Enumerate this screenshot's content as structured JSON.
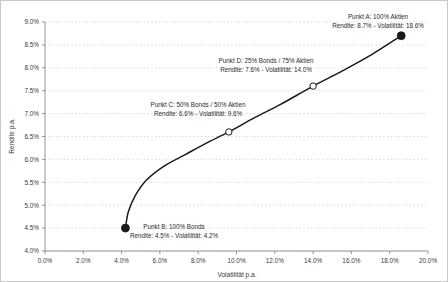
{
  "chart_data": {
    "type": "line",
    "title": "",
    "subtitle": "",
    "xlabel": "Volatilität p.a.",
    "ylabel": "Rendite p.a.",
    "xlim": [
      0.0,
      20.0
    ],
    "ylim": [
      4.0,
      9.0
    ],
    "xticks": [
      "0.0%",
      "2.0%",
      "4.0%",
      "6.0%",
      "8.0%",
      "10.0%",
      "12.0%",
      "14.0%",
      "16.0%",
      "18.0%",
      "20.0%"
    ],
    "xtick_values": [
      0.0,
      2.0,
      4.0,
      6.0,
      8.0,
      10.0,
      12.0,
      14.0,
      16.0,
      18.0,
      20.0
    ],
    "yticks": [
      "4.0%",
      "4.5%",
      "5.0%",
      "5.5%",
      "6.0%",
      "6.5%",
      "7.0%",
      "7.5%",
      "8.0%",
      "8.5%",
      "9.0%"
    ],
    "ytick_values": [
      4.0,
      4.5,
      5.0,
      5.5,
      6.0,
      6.5,
      7.0,
      7.5,
      8.0,
      8.5,
      9.0
    ],
    "grid": true,
    "grid_axis": "y",
    "legend": "none",
    "series": [
      {
        "name": "Effizienzkurve",
        "x": [
          4.2,
          4.35,
          4.7,
          5.3,
          6.2,
          7.3,
          8.4,
          9.6,
          10.9,
          12.3,
          14.0,
          15.6,
          17.1,
          18.6
        ],
        "y": [
          4.5,
          4.85,
          5.2,
          5.55,
          5.85,
          6.1,
          6.35,
          6.6,
          6.9,
          7.2,
          7.6,
          7.95,
          8.3,
          8.7
        ]
      }
    ],
    "points": [
      {
        "id": "A",
        "x": 18.6,
        "y": 8.7,
        "marker": "filled-circle",
        "label_line1": "Punkt A: 100% Aktien",
        "label_line2": "Rendite: 8.7% - Volatilität: 18.6%"
      },
      {
        "id": "D",
        "x": 14.0,
        "y": 7.6,
        "marker": "hollow-circle",
        "label_line1": "Punkt D: 25% Bonds / 75% Aktien",
        "label_line2": "Rendite: 7.6% - Volatilität: 14.0%"
      },
      {
        "id": "C",
        "x": 9.6,
        "y": 6.6,
        "marker": "hollow-circle",
        "label_line1": "Punkt C: 50% Bonds / 50% Aktien",
        "label_line2": "Rendite: 6.6% - Volatilität: 9.6%"
      },
      {
        "id": "B",
        "x": 4.2,
        "y": 4.5,
        "marker": "filled-circle",
        "label_line1": "Punkt B: 100% Bonds",
        "label_line2": "Rendite: 4.5% - Volatilität: 4.2%"
      }
    ],
    "annotations": [
      {
        "id": "A",
        "text_x": 377,
        "text_y": 18,
        "anchor": "middle"
      },
      {
        "id": "D",
        "text_x": 265,
        "text_y": 62,
        "anchor": "middle"
      },
      {
        "id": "C",
        "text_x": 197,
        "text_y": 106,
        "anchor": "middle"
      },
      {
        "id": "B",
        "text_x": 173,
        "text_y": 228,
        "anchor": "middle"
      }
    ],
    "colors": {
      "curve": "#1a1a1a",
      "marker_filled": "#1a1a1a",
      "marker_hollow_fill": "#ffffff",
      "grid": "#bfbfbf",
      "axis": "#8a8a8a",
      "text": "#3a3a3a",
      "background": "#ffffff",
      "frame": "#c8c8c8"
    }
  }
}
